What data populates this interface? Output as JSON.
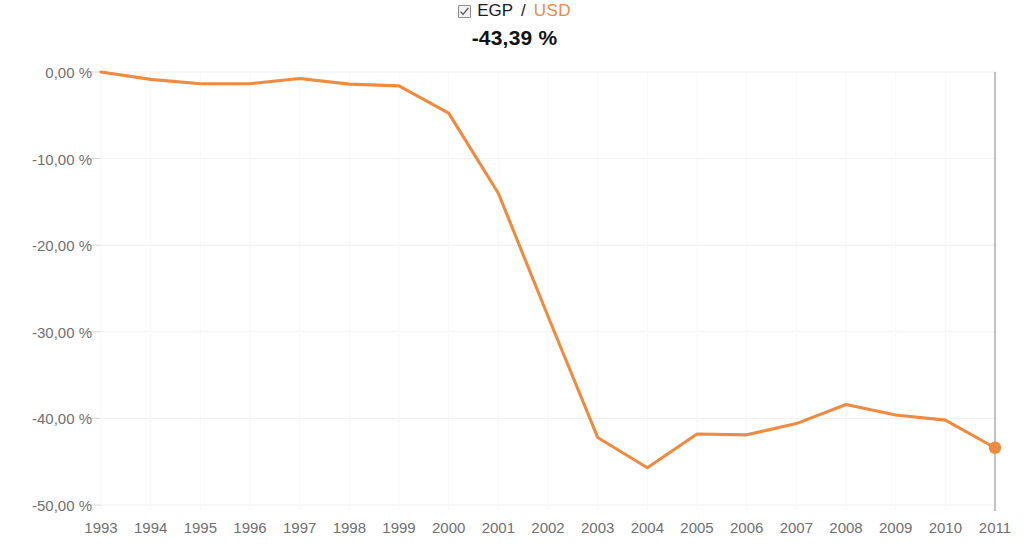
{
  "legend": {
    "checkbox_checked": true,
    "checkbox_icon": "checkmark-icon",
    "base_currency": "EGP",
    "separator": "/",
    "quote_currency": "USD",
    "current_value": "-43,39 %",
    "series_color": "#ef8b41",
    "text_color": "#1a1a1a"
  },
  "chart_data": {
    "type": "line",
    "title": "EGP / USD",
    "xlabel": "",
    "ylabel": "",
    "grid": true,
    "legend_position": "top-center",
    "series_name": "EGP / USD",
    "series_color": "#ef8b41",
    "ylim": [
      -50,
      0
    ],
    "yticks": [
      0,
      -10,
      -20,
      -30,
      -40,
      -50
    ],
    "ytick_labels": [
      "0,00 %",
      "-10,00 %",
      "-20,00 %",
      "-30,00 %",
      "-40,00 %",
      "-50,00 %"
    ],
    "categories": [
      "1993",
      "1994",
      "1995",
      "1996",
      "1997",
      "1998",
      "1999",
      "2000",
      "2001",
      "2002",
      "2003",
      "2004",
      "2005",
      "2006",
      "2007",
      "2008",
      "2009",
      "2010",
      "2011"
    ],
    "values": [
      0.0,
      -0.85,
      -1.35,
      -1.35,
      -0.75,
      -1.4,
      -1.6,
      -4.75,
      -14.0,
      -28.2,
      -42.2,
      -45.7,
      -41.8,
      -41.9,
      -40.6,
      -38.4,
      -39.6,
      -40.2,
      -43.39
    ],
    "end_marker": {
      "category": "2011",
      "value": -43.39,
      "label": "-43,39 %",
      "color": "#ef8b41"
    },
    "annotations": [
      {
        "type": "vertical-line",
        "category": "2011",
        "color": "#a8a8a8"
      }
    ]
  },
  "axis_colors": {
    "tick_text": "#6f7072",
    "gridline": "#f0f0f0",
    "end_line": "#a8a8a8"
  }
}
